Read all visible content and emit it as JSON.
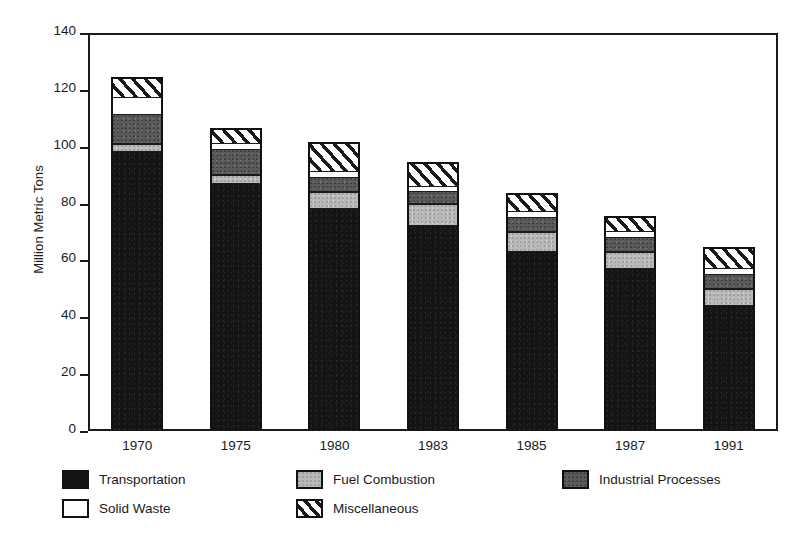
{
  "chart_data": {
    "type": "bar",
    "title": "",
    "subtitle": "",
    "xlabel": "",
    "ylabel": "Million Metric Tons",
    "stacked": true,
    "grid": false,
    "legend_position": "bottom",
    "ylim": [
      0,
      140
    ],
    "yticks": [
      0,
      20,
      40,
      60,
      80,
      100,
      120,
      140
    ],
    "ytick_labels": [
      "0",
      "20",
      "40",
      "60",
      "80",
      "100",
      "120",
      "140"
    ],
    "categories": [
      "1970",
      "1975",
      "1980",
      "1983",
      "1985",
      "1987",
      "1991"
    ],
    "series": [
      {
        "name": "Transportation",
        "color": "#141414",
        "pattern": "solid-black",
        "values": [
          98,
          87,
          78,
          72,
          63,
          57,
          44
        ]
      },
      {
        "name": "Fuel Combustion",
        "color": "#b9b9b9",
        "pattern": "light-gray",
        "values": [
          3,
          3,
          6,
          8,
          7,
          6,
          6
        ]
      },
      {
        "name": "Industrial Processes",
        "color": "#5a5a5a",
        "pattern": "dark-gray",
        "values": [
          10,
          9,
          5,
          4,
          5,
          5,
          5
        ]
      },
      {
        "name": "Solid Waste",
        "color": "#ffffff",
        "pattern": "white",
        "values": [
          6,
          2,
          2,
          2,
          2,
          2,
          2
        ]
      },
      {
        "name": "Miscellaneous",
        "color": "#ffffff",
        "pattern": "diagonal-hatch",
        "values": [
          7,
          5,
          10,
          8,
          6,
          5,
          7
        ]
      }
    ],
    "totals": [
      124,
      106,
      101,
      94,
      83,
      75,
      64
    ]
  },
  "legend": {
    "rows": [
      [
        {
          "label": "Transportation",
          "swatch": "sw-transportation"
        },
        {
          "label": "Fuel Combustion",
          "swatch": "sw-fuel"
        },
        {
          "label": "Industrial Processes",
          "swatch": "sw-industrial"
        }
      ],
      [
        {
          "label": "Solid Waste",
          "swatch": "sw-solid"
        },
        {
          "label": "Miscellaneous",
          "swatch": "sw-misc"
        }
      ]
    ]
  }
}
